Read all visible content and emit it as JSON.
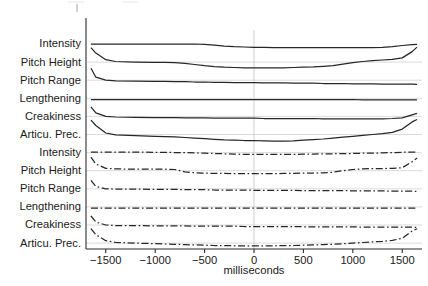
{
  "figure": {
    "title": "",
    "axis": {
      "x_title": "milliseconds",
      "x_ticks": [
        "−1500",
        "−1000",
        "−500",
        "0",
        "500",
        "1000",
        "1500"
      ],
      "x_tick_values": [
        -1500,
        -1000,
        -500,
        0,
        500,
        1000,
        1500
      ],
      "xlim": [
        -1700,
        1700
      ],
      "zero_marker": 0
    },
    "colors": {
      "trace": "#262626",
      "gridline": "#d2d2d2",
      "zeroline": "#c9c9c9",
      "axis": "#2b2b2b",
      "background": "#ffffff"
    },
    "group_labels": {
      "solid_group": "solid-line panel",
      "dashed_group": "dash-dot-line panel"
    }
  },
  "chart_data": {
    "type": "line",
    "title": "",
    "subtitle": "",
    "xlabel": "milliseconds",
    "ylabel": "",
    "xlim": [
      -1700,
      1700
    ],
    "ylim": [
      0,
      1
    ],
    "grid": true,
    "legend": "none",
    "x_ticks": [
      -1500,
      -1000,
      -500,
      0,
      500,
      1000,
      1500
    ],
    "x_tick_labels": [
      "−1500",
      "−1000",
      "−500",
      "0",
      "500",
      "1000",
      "1500"
    ],
    "annotations": [
      "vertical reference line at 0 ms"
    ],
    "x": [
      -1650,
      -1600,
      -1500,
      -1400,
      -1200,
      -1000,
      -900,
      -800,
      -700,
      -600,
      -500,
      -400,
      -300,
      -200,
      -100,
      0,
      100,
      200,
      300,
      400,
      500,
      600,
      700,
      800,
      900,
      1000,
      1100,
      1200,
      1300,
      1400,
      1500,
      1600,
      1650
    ],
    "series": [
      {
        "name": "Intensity",
        "group": "solid",
        "style": "solid",
        "row": 0,
        "values": [
          0.5,
          0.5,
          0.5,
          0.5,
          0.5,
          0.5,
          0.5,
          0.5,
          0.5,
          0.5,
          0.49,
          0.46,
          0.43,
          0.41,
          0.4,
          0.39,
          0.39,
          0.38,
          0.38,
          0.38,
          0.38,
          0.38,
          0.38,
          0.38,
          0.38,
          0.38,
          0.38,
          0.38,
          0.39,
          0.41,
          0.45,
          0.48,
          0.49
        ]
      },
      {
        "name": "Pitch Height",
        "group": "solid",
        "style": "solid",
        "row": 1,
        "values": [
          0.98,
          0.8,
          0.58,
          0.52,
          0.5,
          0.49,
          0.49,
          0.48,
          0.46,
          0.42,
          0.38,
          0.35,
          0.33,
          0.32,
          0.31,
          0.31,
          0.31,
          0.31,
          0.31,
          0.32,
          0.33,
          0.34,
          0.36,
          0.38,
          0.43,
          0.48,
          0.52,
          0.55,
          0.57,
          0.59,
          0.64,
          0.85,
          1.0
        ]
      },
      {
        "name": "Pitch Range",
        "group": "solid",
        "style": "solid",
        "row": 2,
        "values": [
          0.9,
          0.6,
          0.5,
          0.48,
          0.47,
          0.46,
          0.46,
          0.45,
          0.45,
          0.44,
          0.44,
          0.43,
          0.43,
          0.42,
          0.42,
          0.42,
          0.41,
          0.41,
          0.41,
          0.4,
          0.4,
          0.4,
          0.39,
          0.39,
          0.39,
          0.38,
          0.38,
          0.38,
          0.37,
          0.37,
          0.37,
          0.37,
          0.36
        ]
      },
      {
        "name": "Lengthening",
        "group": "solid",
        "style": "solid",
        "row": 3,
        "values": [
          0.46,
          0.46,
          0.46,
          0.46,
          0.46,
          0.46,
          0.46,
          0.46,
          0.46,
          0.46,
          0.46,
          0.46,
          0.46,
          0.46,
          0.46,
          0.46,
          0.46,
          0.46,
          0.46,
          0.46,
          0.46,
          0.46,
          0.46,
          0.46,
          0.46,
          0.46,
          0.45,
          0.45,
          0.45,
          0.45,
          0.45,
          0.45,
          0.45
        ]
      },
      {
        "name": "Creakiness",
        "group": "solid",
        "style": "solid",
        "row": 4,
        "values": [
          0.82,
          0.62,
          0.5,
          0.48,
          0.47,
          0.46,
          0.46,
          0.46,
          0.45,
          0.45,
          0.45,
          0.44,
          0.44,
          0.44,
          0.44,
          0.44,
          0.43,
          0.43,
          0.43,
          0.43,
          0.43,
          0.43,
          0.42,
          0.42,
          0.42,
          0.42,
          0.42,
          0.42,
          0.42,
          0.43,
          0.45,
          0.55,
          0.6
        ]
      },
      {
        "name": "Articu. Prec.",
        "group": "solid",
        "style": "solid",
        "row": 5,
        "values": [
          0.98,
          0.8,
          0.55,
          0.49,
          0.46,
          0.44,
          0.43,
          0.42,
          0.4,
          0.38,
          0.36,
          0.34,
          0.32,
          0.31,
          0.3,
          0.3,
          0.29,
          0.28,
          0.28,
          0.29,
          0.31,
          0.33,
          0.35,
          0.38,
          0.41,
          0.44,
          0.47,
          0.5,
          0.53,
          0.57,
          0.68,
          0.92,
          1.0
        ]
      },
      {
        "name": "Intensity",
        "group": "dashed",
        "style": "dash-dot",
        "row": 6,
        "values": [
          0.52,
          0.52,
          0.52,
          0.52,
          0.52,
          0.51,
          0.51,
          0.5,
          0.5,
          0.49,
          0.48,
          0.47,
          0.46,
          0.45,
          0.44,
          0.44,
          0.44,
          0.44,
          0.44,
          0.44,
          0.45,
          0.45,
          0.46,
          0.46,
          0.47,
          0.47,
          0.48,
          0.48,
          0.49,
          0.5,
          0.51,
          0.52,
          0.52
        ]
      },
      {
        "name": "Pitch Height",
        "group": "dashed",
        "style": "dash-dot",
        "row": 7,
        "values": [
          0.95,
          0.72,
          0.58,
          0.56,
          0.55,
          0.55,
          0.55,
          0.54,
          0.46,
          0.43,
          0.42,
          0.41,
          0.41,
          0.4,
          0.4,
          0.4,
          0.4,
          0.4,
          0.41,
          0.41,
          0.42,
          0.42,
          0.43,
          0.45,
          0.5,
          0.54,
          0.56,
          0.57,
          0.57,
          0.58,
          0.6,
          0.8,
          0.92
        ]
      },
      {
        "name": "Pitch Range",
        "group": "dashed",
        "style": "dash-dot",
        "row": 8,
        "values": [
          0.78,
          0.58,
          0.5,
          0.49,
          0.49,
          0.48,
          0.48,
          0.48,
          0.47,
          0.47,
          0.47,
          0.46,
          0.46,
          0.46,
          0.46,
          0.45,
          0.45,
          0.45,
          0.45,
          0.45,
          0.44,
          0.44,
          0.44,
          0.44,
          0.44,
          0.43,
          0.43,
          0.43,
          0.43,
          0.42,
          0.42,
          0.42,
          0.41
        ]
      },
      {
        "name": "Lengthening",
        "group": "dashed",
        "style": "dash-dot",
        "row": 9,
        "values": [
          0.46,
          0.46,
          0.46,
          0.46,
          0.46,
          0.46,
          0.46,
          0.46,
          0.46,
          0.46,
          0.46,
          0.46,
          0.46,
          0.46,
          0.46,
          0.46,
          0.46,
          0.46,
          0.46,
          0.46,
          0.46,
          0.46,
          0.46,
          0.46,
          0.46,
          0.46,
          0.46,
          0.46,
          0.46,
          0.46,
          0.46,
          0.46,
          0.46
        ]
      },
      {
        "name": "Creakiness",
        "group": "dashed",
        "style": "dash-dot",
        "row": 10,
        "values": [
          0.8,
          0.6,
          0.5,
          0.48,
          0.48,
          0.47,
          0.47,
          0.47,
          0.47,
          0.46,
          0.46,
          0.46,
          0.46,
          0.46,
          0.45,
          0.45,
          0.45,
          0.45,
          0.45,
          0.45,
          0.44,
          0.44,
          0.44,
          0.44,
          0.44,
          0.44,
          0.43,
          0.43,
          0.43,
          0.43,
          0.43,
          0.43,
          0.42
        ]
      },
      {
        "name": "Articu. Prec.",
        "group": "dashed",
        "style": "dash-dot",
        "row": 11,
        "values": [
          0.98,
          0.78,
          0.58,
          0.52,
          0.5,
          0.48,
          0.47,
          0.46,
          0.45,
          0.44,
          0.43,
          0.42,
          0.42,
          0.41,
          0.41,
          0.41,
          0.41,
          0.41,
          0.42,
          0.42,
          0.43,
          0.44,
          0.45,
          0.46,
          0.48,
          0.5,
          0.52,
          0.54,
          0.56,
          0.59,
          0.66,
          0.9,
          0.98
        ]
      }
    ]
  }
}
